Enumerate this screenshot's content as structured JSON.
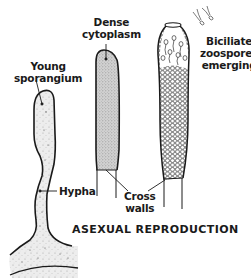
{
  "figure": {
    "title": "ASEXUAL REPRODUCTION",
    "labels": {
      "young_sporangium": [
        "Young",
        "sporangium"
      ],
      "dense_cytoplasm": [
        "Dense",
        "cytoplasm"
      ],
      "biciliate_zoospores": [
        "Biciliate",
        "zoospores",
        "emerging"
      ],
      "hypha": "Hypha",
      "cross_walls": [
        "Cross",
        "walls"
      ]
    },
    "stages": [
      {
        "name": "Young sporangium"
      },
      {
        "name": "Sporangium with dense cytoplasm"
      },
      {
        "name": "Mature sporangium releasing biciliate zoospores"
      }
    ],
    "colors": {
      "outline": "#1a1a1a",
      "stipple_fill": "#e4e4e4",
      "dense_fill": "#c9c9c9",
      "background": "#ffffff"
    }
  }
}
